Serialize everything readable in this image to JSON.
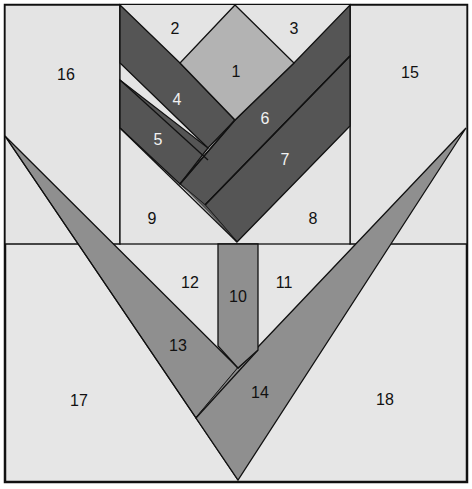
{
  "colors": {
    "background": "#e6e6e6",
    "light_gray": "#e4e4e4",
    "medium_gray": "#b3b3b3",
    "mid_dark_gray": "#8f8f8f",
    "dark_gray": "#555555",
    "stroke": "#111111",
    "label_dark": "#111111",
    "label_light": "#f2f2f2"
  },
  "pieces": [
    {
      "id": "1",
      "label": "1",
      "name": "flower-center-diamond",
      "shade": "medium_gray"
    },
    {
      "id": "2",
      "label": "2",
      "name": "top-left-triangle",
      "shade": "light_gray"
    },
    {
      "id": "3",
      "label": "3",
      "name": "top-right-triangle",
      "shade": "light_gray"
    },
    {
      "id": "4",
      "label": "4",
      "name": "left-petal-inner",
      "shade": "dark_gray"
    },
    {
      "id": "5",
      "label": "5",
      "name": "left-petal-outer",
      "shade": "dark_gray"
    },
    {
      "id": "6",
      "label": "6",
      "name": "right-petal-inner",
      "shade": "dark_gray"
    },
    {
      "id": "7",
      "label": "7",
      "name": "right-petal-outer",
      "shade": "dark_gray"
    },
    {
      "id": "8",
      "label": "8",
      "name": "bottom-right-background-triangle",
      "shade": "light_gray"
    },
    {
      "id": "9",
      "label": "9",
      "name": "bottom-left-background-triangle",
      "shade": "light_gray"
    },
    {
      "id": "10",
      "label": "10",
      "name": "stem",
      "shade": "mid_dark_gray"
    },
    {
      "id": "11",
      "label": "11",
      "name": "right-stem-background",
      "shade": "light_gray"
    },
    {
      "id": "12",
      "label": "12",
      "name": "left-stem-background",
      "shade": "light_gray"
    },
    {
      "id": "13",
      "label": "13",
      "name": "left-leaf",
      "shade": "mid_dark_gray"
    },
    {
      "id": "14",
      "label": "14",
      "name": "right-leaf",
      "shade": "mid_dark_gray"
    },
    {
      "id": "15",
      "label": "15",
      "name": "right-side-strip",
      "shade": "light_gray"
    },
    {
      "id": "16",
      "label": "16",
      "name": "left-side-strip",
      "shade": "light_gray"
    },
    {
      "id": "17",
      "label": "17",
      "name": "bottom-left-corner",
      "shade": "light_gray"
    },
    {
      "id": "18",
      "label": "18",
      "name": "bottom-right-corner",
      "shade": "light_gray"
    }
  ],
  "labels": {
    "p1": "1",
    "p2": "2",
    "p3": "3",
    "p4": "4",
    "p5": "5",
    "p6": "6",
    "p7": "7",
    "p8": "8",
    "p9": "9",
    "p10": "10",
    "p11": "11",
    "p12": "12",
    "p13": "13",
    "p14": "14",
    "p15": "15",
    "p16": "16",
    "p17": "17",
    "p18": "18"
  }
}
